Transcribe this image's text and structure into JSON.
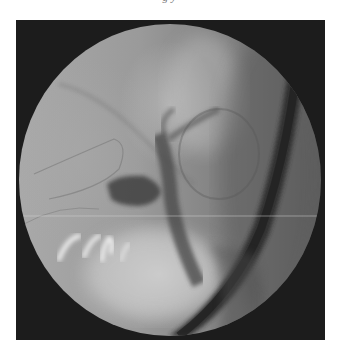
{
  "caption": {
    "text_fragment": "g                                              y"
  },
  "image": {
    "type": "fluoroscopy",
    "description": "Circular fluoroscopic field on dark square background showing a dark diagonal endoscope tube on the right, contrast-filled ducts centrally, and bright bony structures lower left",
    "colors": {
      "background": "#ffffff",
      "frame": "#1c1c1c",
      "field_light": "#b5b5b5",
      "field_mid": "#8c8c8c",
      "tube": "#2e2e2e",
      "contrast": "#4a4a4a"
    }
  }
}
